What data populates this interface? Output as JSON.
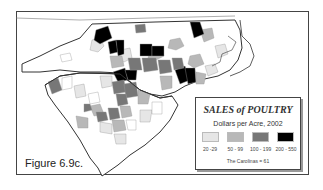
{
  "map": {
    "title": "SALES of POULTRY",
    "subtitle": "Dollars per Acre, 2002",
    "region": "The Carolinas",
    "figure_label": "Figure 6.9c."
  },
  "legend": {
    "title": "SALES of POULTRY",
    "subtitle": "Dollars per Acre, 2002",
    "classes": [
      {
        "label": "20 -29",
        "color": "#e6e6e6"
      },
      {
        "label": "50 - 99",
        "color": "#b8b8b8"
      },
      {
        "label": "100 - 199",
        "color": "#777777"
      },
      {
        "label": "200 - 550",
        "color": "#000000"
      }
    ],
    "note": "The Carolinas = 61"
  },
  "colors": {
    "none": "#ffffff",
    "border": "#333333",
    "county_line": "#9a9a9a"
  }
}
